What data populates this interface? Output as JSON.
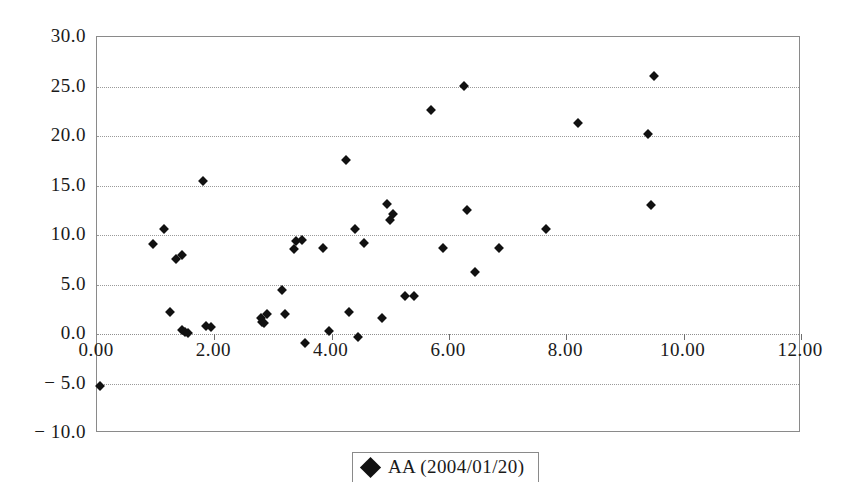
{
  "chart_data": {
    "type": "scatter",
    "title": "",
    "subtitle": "",
    "xlabel": "",
    "ylabel": "",
    "xlim": [
      0.0,
      12.0
    ],
    "ylim": [
      -10.0,
      30.0
    ],
    "grid": true,
    "grid_axis": "y",
    "legend_position": "bottom-center",
    "marker": "filled-diamond",
    "marker_color": "#111111",
    "xticks": [
      0.0,
      2.0,
      4.0,
      6.0,
      8.0,
      10.0,
      12.0
    ],
    "xticklabels": [
      "0.00",
      "2.00",
      "4.00",
      "6.00",
      "8.00",
      "10.00",
      "12.00"
    ],
    "yticks": [
      -10.0,
      -5.0,
      0.0,
      5.0,
      10.0,
      15.0,
      20.0,
      25.0,
      30.0
    ],
    "yticklabels": [
      "− 10.0",
      "− 5.0",
      "0.0",
      "5.0",
      "10.0",
      "15.0",
      "20.0",
      "25.0",
      "30.0"
    ],
    "series": [
      {
        "name": "AA (2004/01/20)",
        "points": [
          [
            0.05,
            -5.3
          ],
          [
            0.95,
            9.1
          ],
          [
            1.15,
            10.6
          ],
          [
            1.25,
            2.2
          ],
          [
            1.35,
            7.6
          ],
          [
            1.45,
            8.0
          ],
          [
            1.45,
            0.4
          ],
          [
            1.5,
            0.2
          ],
          [
            1.55,
            0.1
          ],
          [
            1.8,
            15.5
          ],
          [
            1.85,
            0.8
          ],
          [
            1.95,
            0.7
          ],
          [
            2.8,
            1.6
          ],
          [
            2.82,
            1.2
          ],
          [
            2.85,
            1.1
          ],
          [
            2.9,
            2.0
          ],
          [
            3.15,
            4.4
          ],
          [
            3.2,
            2.0
          ],
          [
            3.35,
            8.6
          ],
          [
            3.4,
            9.4
          ],
          [
            3.5,
            9.5
          ],
          [
            3.55,
            -0.9
          ],
          [
            3.85,
            8.7
          ],
          [
            3.95,
            0.3
          ],
          [
            4.25,
            17.6
          ],
          [
            4.3,
            2.2
          ],
          [
            4.4,
            10.6
          ],
          [
            4.45,
            -0.3
          ],
          [
            4.55,
            9.2
          ],
          [
            4.85,
            1.6
          ],
          [
            4.95,
            13.1
          ],
          [
            5.05,
            12.1
          ],
          [
            5.0,
            11.5
          ],
          [
            5.25,
            3.8
          ],
          [
            5.4,
            3.8
          ],
          [
            5.7,
            22.6
          ],
          [
            5.9,
            8.7
          ],
          [
            6.25,
            25.1
          ],
          [
            6.3,
            12.5
          ],
          [
            6.45,
            6.3
          ],
          [
            6.85,
            8.7
          ],
          [
            7.65,
            10.6
          ],
          [
            8.2,
            21.3
          ],
          [
            9.4,
            20.2
          ],
          [
            9.5,
            26.1
          ],
          [
            9.45,
            13.0
          ]
        ]
      }
    ]
  },
  "legend": {
    "entries": [
      {
        "label": "AA (2004/01/20)",
        "marker": "filled-diamond"
      }
    ]
  }
}
